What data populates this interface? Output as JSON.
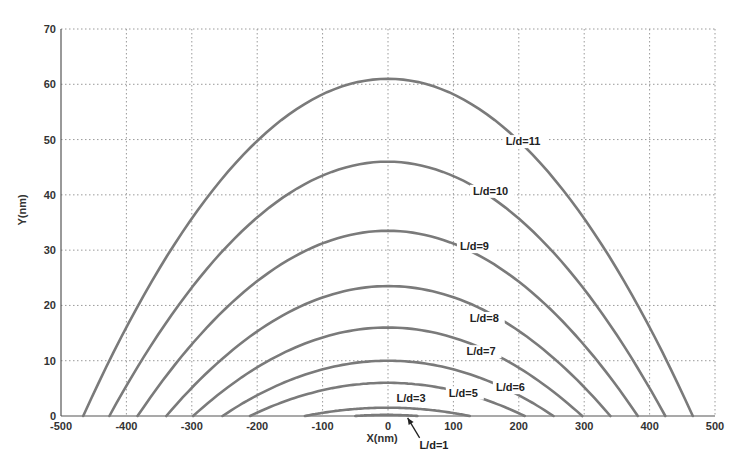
{
  "chart_data": {
    "type": "line",
    "title": "",
    "xlabel": "X(nm)",
    "ylabel": "Y(nm)",
    "xlim": [
      -500,
      500
    ],
    "ylim": [
      0,
      70
    ],
    "xticks": [
      -500,
      -400,
      -300,
      -200,
      -100,
      0,
      100,
      200,
      300,
      400,
      500
    ],
    "yticks": [
      0,
      10,
      20,
      30,
      40,
      50,
      60,
      70
    ],
    "xtick_labels": [
      "-500",
      "-400",
      "-300",
      "-200",
      "-100",
      "0",
      "100",
      "200",
      "300",
      "400",
      "500"
    ],
    "ytick_labels": [
      "0",
      "10",
      "20",
      "30",
      "40",
      "50",
      "60",
      "70"
    ],
    "grid": true,
    "legend": "none (inline curve labels)",
    "series": [
      {
        "name": "L/d=11",
        "x_start": -466,
        "x_end": 466,
        "peak": 61,
        "label_pos": [
          180,
          49
        ]
      },
      {
        "name": "L/d=10",
        "x_start": -426,
        "x_end": 424,
        "peak": 46,
        "label_pos": [
          130,
          40
        ]
      },
      {
        "name": "L/d=9",
        "x_start": -383,
        "x_end": 382,
        "peak": 33.5,
        "label_pos": [
          110,
          30
        ]
      },
      {
        "name": "L/d=8",
        "x_start": -339,
        "x_end": 340,
        "peak": 23.5,
        "label_pos": [
          125,
          17
        ]
      },
      {
        "name": "L/d=7",
        "x_start": -298,
        "x_end": 297,
        "peak": 16,
        "label_pos": [
          120,
          11
        ]
      },
      {
        "name": "L/d=6",
        "x_start": -253,
        "x_end": 253,
        "peak": 10,
        "label_pos": [
          165,
          4.5
        ]
      },
      {
        "name": "L/d=5",
        "x_start": -211,
        "x_end": 209,
        "peak": 6,
        "label_pos": [
          93,
          3.5
        ]
      },
      {
        "name": "L/d=3",
        "x_start": -127,
        "x_end": 125,
        "peak": 1.5,
        "label_pos": [
          13,
          2.6
        ]
      },
      {
        "name": "L/d=1",
        "x_start": -50,
        "x_end": 45,
        "peak": 0.2,
        "label_pos": [
          48,
          -6
        ]
      }
    ],
    "annotations": [
      {
        "text": "L/d=1",
        "arrow_to": [
          30,
          0.2
        ]
      }
    ]
  },
  "colors": {
    "curve": "#7a7a7a",
    "grid": "#9a9a9a",
    "axis": "#555555",
    "text": "#333333"
  }
}
